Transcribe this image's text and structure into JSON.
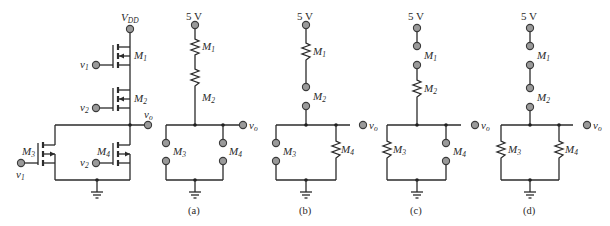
{
  "figure": {
    "main_circuit": {
      "supply_label": "V",
      "supply_sub": "DD",
      "output_label": "v",
      "output_sub": "o",
      "transistors": [
        {
          "name": "M",
          "sub": "1",
          "gate_input": "v",
          "gate_sub": "1",
          "type": "PMOS"
        },
        {
          "name": "M",
          "sub": "2",
          "gate_input": "v",
          "gate_sub": "2",
          "type": "PMOS"
        },
        {
          "name": "M",
          "sub": "3",
          "gate_input": "v",
          "gate_sub": "1",
          "type": "NMOS"
        },
        {
          "name": "M",
          "sub": "4",
          "gate_input": "v",
          "gate_sub": "2",
          "type": "NMOS"
        }
      ]
    },
    "variants": [
      {
        "caption": "(a)",
        "supply": "5 V",
        "output": "v",
        "output_sub": "o",
        "states": {
          "M1": "resistor",
          "M2": "resistor",
          "M3": "open",
          "M4": "open"
        }
      },
      {
        "caption": "(b)",
        "supply": "5 V",
        "output": "v",
        "output_sub": "o",
        "states": {
          "M1": "resistor",
          "M2": "open",
          "M3": "open",
          "M4": "resistor"
        }
      },
      {
        "caption": "(c)",
        "supply": "5 V",
        "output": "v",
        "output_sub": "o",
        "states": {
          "M1": "open",
          "M2": "resistor",
          "M3": "resistor",
          "M4": "open"
        }
      },
      {
        "caption": "(d)",
        "supply": "5 V",
        "output": "v",
        "output_sub": "o",
        "states": {
          "M1": "open",
          "M2": "open",
          "M3": "resistor",
          "M4": "resistor"
        }
      }
    ],
    "labels": {
      "m": "M",
      "s1": "1",
      "s2": "2",
      "s3": "3",
      "s4": "4",
      "v": "v",
      "o": "o"
    }
  }
}
